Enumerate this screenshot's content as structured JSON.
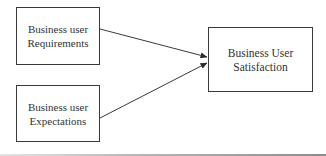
{
  "diagram": {
    "type": "flow",
    "nodes": [
      {
        "id": "requirements",
        "label": "Business user\nRequirements"
      },
      {
        "id": "expectations",
        "label": "Business user\nExpectations"
      },
      {
        "id": "satisfaction",
        "label": "Business User\nSatisfaction"
      }
    ],
    "edges": [
      {
        "from": "requirements",
        "to": "satisfaction"
      },
      {
        "from": "expectations",
        "to": "satisfaction"
      }
    ],
    "colors": {
      "stroke": "#3a3a3a",
      "text": "#333333",
      "background": "#ffffff"
    }
  }
}
